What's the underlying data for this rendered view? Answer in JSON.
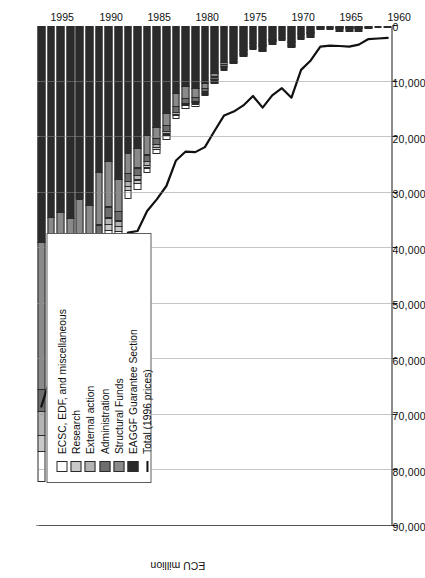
{
  "axis": {
    "value_axis_title": "ECU million",
    "value_ticks": [
      "90,000",
      "80,000",
      "70,000",
      "60,000",
      "50,000",
      "40,000",
      "30,000",
      "20,000",
      "10,000",
      "0"
    ],
    "value_tick_numbers": [
      90000,
      80000,
      70000,
      60000,
      50000,
      40000,
      30000,
      20000,
      10000,
      0
    ],
    "category_ticks": [
      "1960",
      "1965",
      "1970",
      "1975",
      "1980",
      "1985",
      "1990",
      "1995"
    ]
  },
  "legend": {
    "items": [
      {
        "label": "ECSC, EDF, and miscellaneous",
        "color": "#ffffff",
        "icon": "legend-swatch"
      },
      {
        "label": "Research",
        "color": "#c9c9c9",
        "icon": "legend-swatch"
      },
      {
        "label": "External action",
        "color": "#b4b4b4",
        "icon": "legend-swatch"
      },
      {
        "label": "Administration",
        "color": "#6e6e6e",
        "icon": "legend-swatch"
      },
      {
        "label": "Structural Funds",
        "color": "#8a8a8a",
        "icon": "legend-swatch"
      },
      {
        "label": "EAGGF Guarantee Section",
        "color": "#2b2b2b",
        "icon": "legend-swatch"
      },
      {
        "label": "Total (1996 prices)",
        "color": "#111111",
        "icon": "legend-line"
      }
    ]
  },
  "chart_data": {
    "type": "bar",
    "orientation": "horizontal-stacked",
    "title": "",
    "xlabel": "ECU million",
    "ylabel": "",
    "xlim": [
      0,
      90000
    ],
    "grid": true,
    "legend_position": "inside-lower-left",
    "categories": [
      "1960",
      "1961",
      "1962",
      "1963",
      "1964",
      "1965",
      "1966",
      "1967",
      "1968",
      "1969",
      "1970",
      "1971",
      "1972",
      "1973",
      "1974",
      "1975",
      "1976",
      "1977",
      "1978",
      "1979",
      "1980",
      "1981",
      "1982",
      "1983",
      "1984",
      "1985",
      "1986",
      "1987",
      "1988",
      "1989",
      "1990",
      "1991",
      "1992",
      "1993",
      "1994",
      "1995",
      "1996"
    ],
    "series": [
      {
        "name": "EAGGF Guarantee Section",
        "color": "#2b2b2b",
        "values": [
          0,
          0,
          0,
          29,
          49,
          29,
          0,
          0,
          1260,
          1669,
          3108,
          1884,
          2478,
          3615,
          3272,
          4530,
          5637,
          6587,
          8673,
          10441,
          11292,
          10980,
          12260,
          15786,
          18331,
          19728,
          22118,
          22950,
          27687,
          24408,
          26454,
          32386,
          31216,
          34749,
          33592,
          34490,
          39108
        ]
      },
      {
        "name": "Structural Funds",
        "color": "#8a8a8a",
        "values": [
          0,
          0,
          0,
          4,
          2,
          3,
          4,
          6,
          13,
          39,
          66,
          97,
          175,
          279,
          175,
          230,
          290,
          500,
          723,
          1035,
          1808,
          2268,
          2516,
          2403,
          2137,
          3703,
          3675,
          3764,
          5865,
          8406,
          9581,
          12245,
          14686,
          18637,
          18500,
          22400,
          26500
        ]
      },
      {
        "name": "Administration",
        "color": "#6e6e6e",
        "values": [
          7,
          9,
          11,
          16,
          21,
          27,
          35,
          50,
          71,
          81,
          96,
          120,
          152,
          265,
          345,
          420,
          485,
          570,
          650,
          760,
          880,
          1000,
          1100,
          1190,
          1280,
          1380,
          1530,
          1700,
          1900,
          2100,
          2300,
          2550,
          2800,
          3100,
          3400,
          3800,
          4100
        ]
      },
      {
        "name": "External action",
        "color": "#b4b4b4",
        "values": [
          0,
          0,
          0,
          0,
          0,
          0,
          0,
          0,
          0,
          0,
          0,
          0,
          0,
          10,
          24,
          50,
          90,
          140,
          200,
          260,
          330,
          420,
          500,
          560,
          640,
          780,
          900,
          1000,
          1100,
          1260,
          1400,
          1600,
          1900,
          2400,
          3200,
          3900,
          4500
        ]
      },
      {
        "name": "Research",
        "color": "#c9c9c9",
        "values": [
          0,
          0,
          0,
          30,
          40,
          45,
          55,
          65,
          70,
          75,
          80,
          90,
          100,
          110,
          120,
          140,
          160,
          190,
          210,
          230,
          290,
          340,
          390,
          440,
          500,
          620,
          750,
          880,
          1050,
          1300,
          1500,
          1700,
          1900,
          2100,
          2500,
          2800,
          3000
        ]
      },
      {
        "name": "ECSC, EDF, and miscellaneous",
        "color": "#ffffff",
        "values": [
          21,
          25,
          28,
          35,
          40,
          45,
          50,
          60,
          70,
          80,
          95,
          110,
          130,
          160,
          190,
          230,
          270,
          320,
          380,
          450,
          520,
          600,
          690,
          790,
          900,
          1050,
          1250,
          1500,
          1750,
          2050,
          2400,
          2750,
          3200,
          3700,
          4300,
          5000,
          5600
        ]
      }
    ],
    "total_line": {
      "name": "Total (1996 prices)",
      "color": "#111111",
      "values": [
        2150,
        2250,
        2350,
        3350,
        3700,
        3600,
        3550,
        3700,
        6200,
        7900,
        12900,
        11200,
        12500,
        14700,
        12600,
        14300,
        15400,
        16100,
        18900,
        21800,
        22700,
        22600,
        24200,
        28800,
        31200,
        33300,
        36900,
        37200,
        44000,
        41500,
        43600,
        50300,
        51500,
        58100,
        58500,
        63000,
        68500
      ]
    }
  }
}
